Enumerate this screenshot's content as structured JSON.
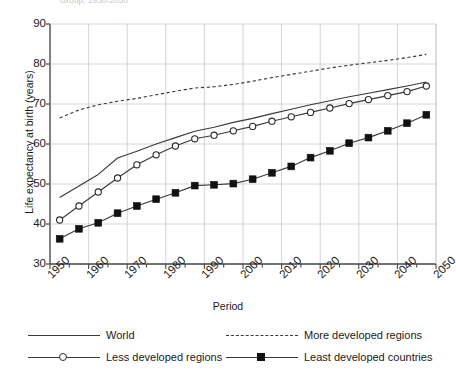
{
  "figure": {
    "clipped_title": "Group, 1950-2050",
    "axis_color": "#4a4a4a",
    "grid_color": "#c9c9c9",
    "line_color": "#3a3a3a",
    "marker_fill_open": "#ffffff",
    "marker_fill_solid": "#111111"
  },
  "chart_data": {
    "type": "line",
    "title": "",
    "xlabel": "Period",
    "ylabel": "Life expectancy at birth (years)",
    "xlim": [
      1950,
      2050
    ],
    "ylim": [
      30,
      90
    ],
    "xticks": [
      1950,
      1960,
      1970,
      1980,
      1990,
      2000,
      2010,
      2020,
      2030,
      2040,
      2050
    ],
    "xtick_labels": [
      "1950",
      "1960",
      "1970",
      "1980",
      "1990",
      "2000",
      "2010",
      "2020",
      "2030",
      "2040",
      "2050"
    ],
    "yticks": [
      30,
      40,
      50,
      60,
      70,
      80,
      90
    ],
    "ytick_labels": [
      "30",
      "40",
      "50",
      "60",
      "70",
      "80",
      "90"
    ],
    "minor_xtick_step": 5,
    "grid": "both",
    "legend_position": "bottom",
    "x": [
      1952.5,
      1957.5,
      1962.5,
      1967.5,
      1972.5,
      1977.5,
      1982.5,
      1987.5,
      1992.5,
      1997.5,
      2002.5,
      2007.5,
      2012.5,
      2017.5,
      2022.5,
      2027.5,
      2032.5,
      2037.5,
      2042.5,
      2047.5
    ],
    "series": [
      {
        "name": "World",
        "style": "solid",
        "marker": "none",
        "values": [
          46.6,
          49.5,
          52.4,
          56.5,
          58.2,
          60.0,
          61.6,
          63.2,
          64.2,
          65.4,
          66.4,
          67.6,
          68.7,
          69.8,
          70.8,
          71.8,
          72.7,
          73.6,
          74.5,
          75.5
        ]
      },
      {
        "name": "More developed regions",
        "style": "dashed",
        "marker": "none",
        "values": [
          66.5,
          68.5,
          69.8,
          70.7,
          71.4,
          72.3,
          73.2,
          74.0,
          74.3,
          74.9,
          75.7,
          76.6,
          77.4,
          78.2,
          79.0,
          79.7,
          80.3,
          80.9,
          81.6,
          82.4
        ]
      },
      {
        "name": "Less developed regions",
        "style": "solid",
        "marker": "circle",
        "values": [
          41.0,
          44.5,
          48.0,
          51.5,
          54.8,
          57.3,
          59.5,
          61.3,
          62.2,
          63.3,
          64.4,
          65.7,
          66.8,
          67.9,
          69.0,
          70.1,
          71.1,
          72.1,
          73.1,
          74.5
        ]
      },
      {
        "name": "Least developed countries",
        "style": "solid",
        "marker": "square",
        "values": [
          36.3,
          38.8,
          40.3,
          42.7,
          44.5,
          46.2,
          47.8,
          49.6,
          49.8,
          50.1,
          51.2,
          52.8,
          54.4,
          56.6,
          58.3,
          60.2,
          61.6,
          63.3,
          65.2,
          67.3
        ]
      }
    ]
  },
  "legend": {
    "items": [
      {
        "label": "World",
        "marker": "line",
        "style": "solid"
      },
      {
        "label": "More developed regions",
        "marker": "line",
        "style": "dashed"
      },
      {
        "label": "Less developed regions",
        "marker": "circle",
        "style": "solid"
      },
      {
        "label": "Least developed countries",
        "marker": "square",
        "style": "solid"
      }
    ]
  }
}
